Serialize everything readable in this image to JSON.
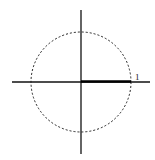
{
  "diagram": {
    "type": "unit-circle",
    "center": [
      81,
      82
    ],
    "radius": 50,
    "segment_label": "1",
    "colors": {
      "stroke": "#111111",
      "circle": "#222222"
    }
  }
}
